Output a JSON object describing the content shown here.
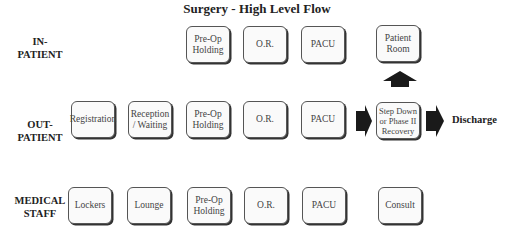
{
  "title": "Surgery - High Level Flow",
  "rows": {
    "inpatient": {
      "label_line1": "IN-",
      "label_line2": "PATIENT",
      "boxes": [
        "Pre-Op Holding",
        "O.R.",
        "PACU",
        "Patient Room"
      ]
    },
    "outpatient": {
      "label_line1": "OUT-",
      "label_line2": "PATIENT",
      "boxes": [
        "Registration",
        "Reception / Waiting",
        "Pre-Op Holding",
        "O.R.",
        "PACU",
        "Step Down or Phase II Recovery"
      ]
    },
    "staff": {
      "label_line1": "MEDICAL",
      "label_line2": "STAFF",
      "boxes": [
        "Lockers",
        "Lounge",
        "Pre-Op Holding",
        "O.R.",
        "PACU",
        "Consult"
      ]
    }
  },
  "discharge": "Discharge",
  "colors": {
    "box_border": "#555555",
    "arrow": "#1a1a1a"
  }
}
